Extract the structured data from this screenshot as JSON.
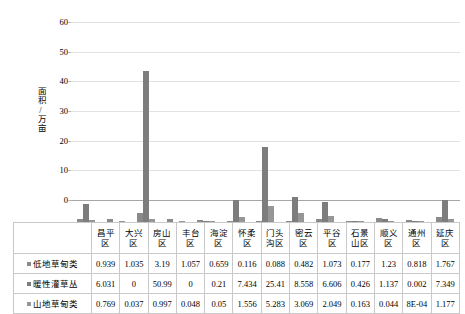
{
  "chart_data": {
    "type": "bar",
    "title": "",
    "xlabel": "",
    "ylabel": "面积/万亩",
    "ylim": [
      0,
      60
    ],
    "yticks": [
      0,
      10,
      20,
      30,
      40,
      50,
      60
    ],
    "grid": true,
    "legend_position": "table-row-labels",
    "categories": [
      "昌平区",
      "大兴区",
      "房山区",
      "丰台区",
      "海淀区",
      "怀柔区",
      "门头沟区",
      "密云区",
      "平谷区",
      "石景山区",
      "顺义区",
      "通州区",
      "延庆区"
    ],
    "series": [
      {
        "name": "低地草甸类",
        "values": [
          0.939,
          1.035,
          3.19,
          1.057,
          0.659,
          0.116,
          0.088,
          0.482,
          1.073,
          0.177,
          1.23,
          0.818,
          1.767
        ],
        "labels": [
          "0.939",
          "1.035",
          "3.19",
          "1.057",
          "0.659",
          "0.116",
          "0.088",
          "0.482",
          "1.073",
          "0.177",
          "1.23",
          "0.818",
          "1.767"
        ],
        "color": "#8a8a8a"
      },
      {
        "name": "暖性灌草丛",
        "values": [
          6.031,
          0,
          50.99,
          0,
          0.21,
          7.434,
          25.41,
          8.558,
          6.606,
          0.426,
          1.137,
          0.002,
          7.349
        ],
        "labels": [
          "6.031",
          "0",
          "50.99",
          "0",
          "0.21",
          "7.434",
          "25.41",
          "8.558",
          "6.606",
          "0.426",
          "1.137",
          "0.002",
          "7.349"
        ],
        "color": "#7d7d7d"
      },
      {
        "name": "山地草甸类",
        "values": [
          0.769,
          0.037,
          0.997,
          0.048,
          0.05,
          1.556,
          5.283,
          3.069,
          2.049,
          0.163,
          0.044,
          0.0008,
          1.177
        ],
        "labels": [
          "0.769",
          "0.037",
          "0.997",
          "0.048",
          "0.05",
          "1.556",
          "5.283",
          "3.069",
          "2.049",
          "0.163",
          "0.044",
          "8E-04",
          "1.177"
        ],
        "color": "#969696"
      }
    ]
  },
  "table": {
    "header_blank": "",
    "columns": [
      "昌平区",
      "大兴区",
      "房山区",
      "丰台区",
      "海淀区",
      "怀柔区",
      "门头沟区",
      "密云区",
      "平谷区",
      "石景山区",
      "顺义区",
      "通州区",
      "延庆区"
    ],
    "column_lines": [
      [
        "昌平",
        "区"
      ],
      [
        "大兴",
        "区"
      ],
      [
        "房山",
        "区"
      ],
      [
        "丰台",
        "区"
      ],
      [
        "海淀",
        "区"
      ],
      [
        "怀柔",
        "区"
      ],
      [
        "门头",
        "沟区"
      ],
      [
        "密云",
        "区"
      ],
      [
        "平谷",
        "区"
      ],
      [
        "石景",
        "山区"
      ],
      [
        "顺义",
        "区"
      ],
      [
        "通州",
        "区"
      ],
      [
        "延庆",
        "区"
      ]
    ],
    "rows": [
      {
        "label": "低地草甸类",
        "values": [
          "0.939",
          "1.035",
          "3.19",
          "1.057",
          "0.659",
          "0.116",
          "0.088",
          "0.482",
          "1.073",
          "0.177",
          "1.23",
          "0.818",
          "1.767"
        ]
      },
      {
        "label": "暖性灌草丛",
        "values": [
          "6.031",
          "0",
          "50.99",
          "0",
          "0.21",
          "7.434",
          "25.41",
          "8.558",
          "6.606",
          "0.426",
          "1.137",
          "0.002",
          "7.349"
        ]
      },
      {
        "label": "山地草甸类",
        "values": [
          "0.769",
          "0.037",
          "0.997",
          "0.048",
          "0.05",
          "1.556",
          "5.283",
          "3.069",
          "2.049",
          "0.163",
          "0.044",
          "8E-04",
          "1.177"
        ]
      }
    ]
  },
  "colors": {
    "bar_series_1": "#8a8a8a",
    "bar_series_2": "#7d7d7d",
    "bar_series_3": "#969696",
    "gridline": "#e2e2e2",
    "table_border": "#c9c9c9"
  }
}
